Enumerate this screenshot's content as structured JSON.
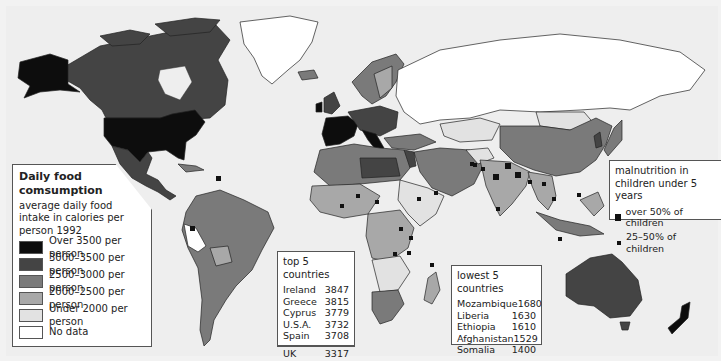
{
  "map": {
    "title": "Daily food consumption",
    "subtitle": "average daily food intake in calories per person 1992",
    "colors": {
      "over_3500": "#0d0d0d",
      "3000_3500": "#444444",
      "2500_3000": "#7a7a7a",
      "2000_2500": "#a8a8a8",
      "under_2000": "#e2e2e2",
      "no_data": "#ffffff",
      "sea": "#eeeeee"
    }
  },
  "legend": {
    "title": "Daily food comsumption",
    "subtitle": "average daily food intake in calories per person 1992",
    "items": [
      {
        "label": "Over 3500 per person",
        "color": "#0d0d0d"
      },
      {
        "label": "3000–3500 per person",
        "color": "#444444"
      },
      {
        "label": "2500–3000 per person",
        "color": "#7a7a7a"
      },
      {
        "label": "2000–2500 per person",
        "color": "#a8a8a8"
      },
      {
        "label": "Under 2000 per person",
        "color": "#e2e2e2"
      },
      {
        "label": "No data",
        "color": "#ffffff"
      }
    ]
  },
  "top5": {
    "heading": "top 5 countries",
    "rows": [
      {
        "country": "Ireland",
        "value": "3847"
      },
      {
        "country": "Greece",
        "value": "3815"
      },
      {
        "country": "Cyprus",
        "value": "3779"
      },
      {
        "country": "U.S.A.",
        "value": "3732"
      },
      {
        "country": "Spain",
        "value": "3708"
      }
    ],
    "extra": {
      "country": "UK",
      "value": "3317"
    }
  },
  "lowest5": {
    "heading": "lowest 5 countries",
    "rows": [
      {
        "country": "Mozambique",
        "value": "1680"
      },
      {
        "country": "Liberia",
        "value": "1630"
      },
      {
        "country": "Ethiopia",
        "value": "1610"
      },
      {
        "country": "Afghanistan",
        "value": "1529"
      },
      {
        "country": "Somalia",
        "value": "1400"
      }
    ]
  },
  "malnutrition": {
    "title": "malnutrition in children under 5 years",
    "items": [
      {
        "label": "over 50% of children",
        "marker": "large-square"
      },
      {
        "label": "25–50% of children",
        "marker": "small-square"
      }
    ]
  }
}
